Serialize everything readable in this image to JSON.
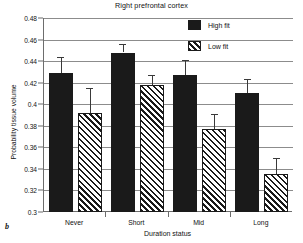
{
  "panel_label": "b",
  "chart_data": {
    "type": "bar",
    "title": "Right prefrontal cortex",
    "xlabel": "Duration status",
    "ylabel": "Probability tissue volume",
    "categories": [
      "Never",
      "Short",
      "Mid",
      "Long"
    ],
    "ylim": [
      0.3,
      0.48
    ],
    "yticks": [
      0.3,
      0.32,
      0.34,
      0.36,
      0.38,
      0.4,
      0.42,
      0.44,
      0.46,
      0.48
    ],
    "ytick_labels": [
      "0.3",
      "0.32",
      "0.34",
      "0.36",
      "0.38",
      "0.4",
      "0.42",
      "0.44",
      "0.46",
      "0.48"
    ],
    "grid": true,
    "legend_position": "top-right",
    "series": [
      {
        "name": "High fit",
        "fill": "solid",
        "color": "#1a1a1a",
        "values": [
          0.429,
          0.448,
          0.427,
          0.41
        ],
        "errors": [
          0.015,
          0.008,
          0.014,
          0.013
        ]
      },
      {
        "name": "Low fit",
        "fill": "diagonal-hatch",
        "color": "#1a1a1a",
        "values": [
          0.392,
          0.418,
          0.377,
          0.335
        ],
        "errors": [
          0.023,
          0.009,
          0.014,
          0.015
        ]
      }
    ]
  }
}
